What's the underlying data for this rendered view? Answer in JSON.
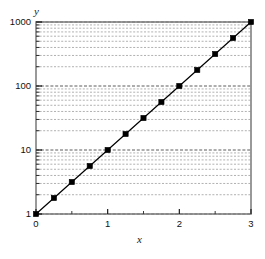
{
  "chart_data": {
    "type": "line",
    "title": "",
    "subtitle": "",
    "xlabel": "x",
    "ylabel": "y",
    "xscale": "linear",
    "yscale": "log",
    "xlim": [
      0,
      3
    ],
    "ylim": [
      1,
      1000
    ],
    "grid": "horizontal minor log gridlines, dashed, light gray",
    "legend": "none",
    "legend_position": "none",
    "xticks": [
      0,
      1,
      2,
      3
    ],
    "xtick_labels": [
      "0",
      "1",
      "2",
      "3"
    ],
    "yticks": [
      1,
      10,
      100,
      1000
    ],
    "ytick_labels": [
      "1",
      "10",
      "100",
      "1000"
    ],
    "y_minor_ticks": [
      2,
      3,
      4,
      5,
      6,
      7,
      8,
      9,
      20,
      30,
      40,
      50,
      60,
      70,
      80,
      90,
      200,
      300,
      400,
      500,
      600,
      700,
      800,
      900
    ],
    "series": [
      {
        "name": "y = 10^x",
        "marker": "filled-square",
        "marker_color": "#000000",
        "line_color": "#000000",
        "x": [
          0,
          0.25,
          0.5,
          0.75,
          1,
          1.25,
          1.5,
          1.75,
          2,
          2.25,
          2.5,
          2.75,
          3
        ],
        "values": [
          1,
          1.78,
          3.16,
          5.62,
          10,
          17.8,
          31.6,
          56.2,
          100,
          178,
          316,
          562,
          1000
        ]
      }
    ],
    "annotations": []
  },
  "axes": {
    "y_title": "y",
    "x_title": "x"
  },
  "colors": {
    "line": "#000000",
    "marker": "#000000",
    "frame": "#808080",
    "gridline": "#a8a8a8",
    "background": "#ffffff",
    "text": "#111111"
  }
}
